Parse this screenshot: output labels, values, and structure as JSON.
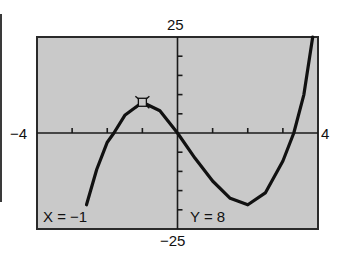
{
  "chart_data": {
    "type": "line",
    "title": "",
    "xlabel": "",
    "ylabel": "",
    "xlim": [
      -4,
      4
    ],
    "ylim": [
      -25,
      25
    ],
    "grid": false,
    "tick_labels": {
      "xmin": "−4",
      "xmax": "4",
      "ymax": "25",
      "ymin": "−25"
    },
    "x_ticks": [
      -3,
      -2,
      -1,
      1,
      2,
      3
    ],
    "y_ticks": [
      -20,
      -15,
      -10,
      -5,
      5,
      10,
      15,
      20
    ],
    "series": [
      {
        "name": "cubic curve",
        "x": [
          -2.59,
          -2.3,
          -2.0,
          -1.81,
          -1.5,
          -1.0,
          -0.5,
          0.0,
          0.5,
          1.0,
          1.5,
          2.0,
          2.5,
          3.0,
          3.31,
          3.6,
          3.85
        ],
        "y": [
          -18.7,
          -9.5,
          -2.4,
          0.0,
          4.6,
          8.0,
          5.8,
          0.0,
          -6.6,
          -12.5,
          -17.0,
          -18.7,
          -15.6,
          -7.3,
          0.0,
          10.0,
          25.0
        ]
      }
    ],
    "annotations": [
      {
        "type": "trace-cursor",
        "x": -1,
        "y": 8
      }
    ],
    "readout": {
      "x_label": "X = −1",
      "y_label": "Y = 8"
    }
  },
  "colors": {
    "screen": "#c9c9c9",
    "curve": "#111111",
    "frame": "#2a2a2a"
  }
}
